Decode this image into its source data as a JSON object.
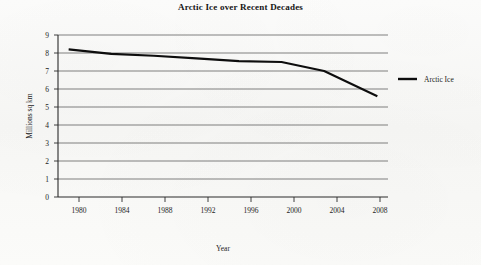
{
  "chart_data": {
    "type": "line",
    "title": "Arctic Ice over Recent Decades",
    "xlabel": "Year",
    "ylabel": "Millions sq km",
    "xlim": [
      1979,
      2010
    ],
    "ylim": [
      0,
      9
    ],
    "xticks": [
      1980,
      1984,
      1988,
      1992,
      1996,
      2000,
      2004,
      2008
    ],
    "yticks": [
      0,
      1,
      2,
      3,
      4,
      5,
      6,
      7,
      8,
      9
    ],
    "grid": "horizontal",
    "legend_position": "right",
    "series": [
      {
        "name": "Arctic Ice",
        "color": "#0d0d0d",
        "x": [
          1980,
          1984,
          1988,
          1992,
          1996,
          2000,
          2004,
          2009
        ],
        "values": [
          8.2,
          7.95,
          7.85,
          7.7,
          7.55,
          7.5,
          7.0,
          5.6
        ]
      }
    ]
  },
  "axes": {
    "y_tick_labels": [
      "9",
      "8",
      "7",
      "6",
      "5",
      "4",
      "3",
      "2",
      "1",
      "0"
    ],
    "x_tick_labels": [
      "1980",
      "1984",
      "1988",
      "1992",
      "1996",
      "2000",
      "2004",
      "2008"
    ],
    "x_axis_title": "Year",
    "y_axis_title": "Millions sq km"
  },
  "legend": {
    "entries": [
      {
        "label": "Arctic Ice",
        "color": "#0d0d0d"
      }
    ]
  },
  "title": "Arctic Ice over Recent Decades"
}
